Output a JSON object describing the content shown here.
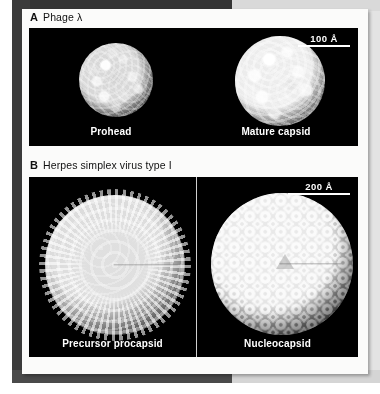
{
  "figure": {
    "panels": [
      {
        "letter": "A",
        "title": "Phage λ",
        "scalebar": "100 Å",
        "images": [
          {
            "caption": "Prohead",
            "subject": "phage-lambda-prohead"
          },
          {
            "caption": "Mature capsid",
            "subject": "phage-lambda-mature-capsid"
          }
        ]
      },
      {
        "letter": "B",
        "title": "Herpes simplex virus type I",
        "scalebar": "200 Å",
        "images": [
          {
            "caption": "Precursor procapsid",
            "subject": "hsv1-precursor-procapsid"
          },
          {
            "caption": "Nucleocapsid",
            "subject": "hsv1-nucleocapsid"
          }
        ]
      }
    ]
  },
  "colors": {
    "page": "#fbfbfa",
    "mat_dark": "#3a3a3a",
    "mat_light": "#d9d9d9",
    "image_background": "#000000",
    "overlay_text": "#ffffff",
    "body_text": "#111111"
  }
}
